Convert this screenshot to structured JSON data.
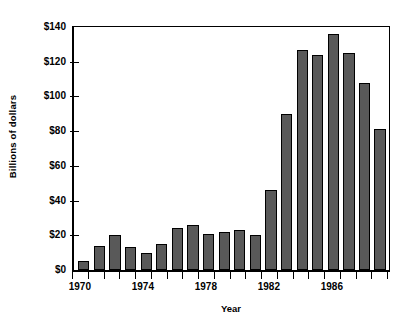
{
  "chart_data": {
    "type": "bar",
    "title": "",
    "subtitle": "",
    "xlabel": "Year",
    "ylabel": "Billions of dollars",
    "categories": [
      "1970",
      "1971",
      "1972",
      "1973",
      "1974",
      "1975",
      "1976",
      "1977",
      "1978",
      "1979",
      "1980",
      "1981",
      "1982",
      "1983",
      "1984",
      "1985",
      "1986",
      "1987",
      "1988",
      "1989"
    ],
    "values": [
      5,
      14,
      20,
      13,
      10,
      15,
      24,
      26,
      21,
      22,
      23,
      20,
      46,
      90,
      127,
      124,
      136,
      125,
      108,
      81
    ],
    "xlim": [
      "1970",
      "1989"
    ],
    "ylim": [
      0,
      140
    ],
    "ytick_values": [
      0,
      20,
      40,
      60,
      80,
      100,
      120,
      140
    ],
    "ytick_labels": [
      "$0",
      "$20",
      "$40",
      "$60",
      "$80",
      "$100",
      "$120",
      "$140"
    ],
    "xtick_labels": [
      "1970",
      "1974",
      "1978",
      "1982",
      "1986"
    ],
    "xtick_label_indices": [
      0,
      4,
      8,
      12,
      16
    ],
    "grid": false,
    "legend": false,
    "legend_position": "none",
    "bar_color": "#595959",
    "bar_edge_color": "#000000",
    "axis_color": "#000000",
    "background_color": "#ffffff"
  }
}
